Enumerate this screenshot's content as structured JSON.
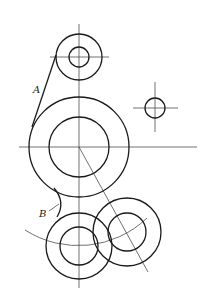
{
  "diagram": {
    "type": "technical-drawing",
    "colors": {
      "line": "#1a1a1a",
      "centerline": "#333333",
      "background": "#ffffff"
    },
    "labels": {
      "a": "A",
      "b": "B"
    },
    "circles": [
      {
        "name": "top-circle",
        "cx": 79,
        "cy": 57,
        "r_outer": 23,
        "r_inner": 10
      },
      {
        "name": "large-circle",
        "cx": 79,
        "cy": 147,
        "r_outer": 50,
        "r_inner": 30
      },
      {
        "name": "small-right-circle",
        "cx": 155,
        "cy": 108,
        "r": 10
      },
      {
        "name": "bottom-left-circle",
        "cx": 79,
        "cy": 246,
        "r_outer": 33,
        "r_inner": 19
      },
      {
        "name": "bottom-right-circle",
        "cx": 127,
        "cy": 232,
        "r_outer": 34,
        "r_inner": 19
      }
    ],
    "tangent_line_label": "A",
    "fillet_arc_label": "B"
  }
}
